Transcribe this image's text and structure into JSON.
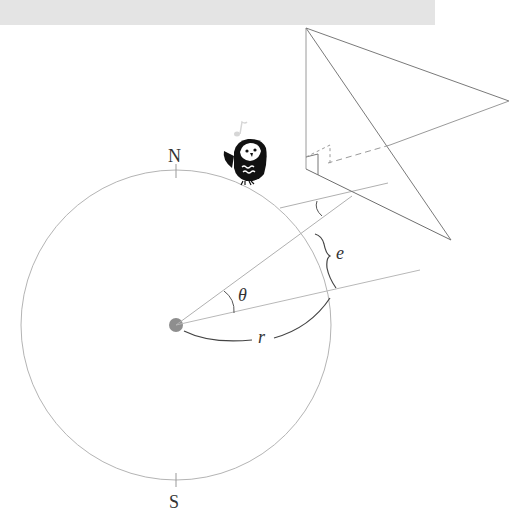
{
  "diagram": {
    "labels": {
      "north": "N",
      "south": "S",
      "theta": "θ",
      "e": "e",
      "r": "r"
    },
    "colors": {
      "top_bar": "#e4e4e4",
      "circle_stroke": "#b0b0b0",
      "ray_stroke": "#a8a8a8",
      "pyramid_stroke": "#7a7a7a",
      "center_dot": "#8e8e8e",
      "label": "#333333",
      "owl": "#111111"
    },
    "icons": {
      "mascot": "owl-icon",
      "music_note": "music-note-icon"
    }
  }
}
